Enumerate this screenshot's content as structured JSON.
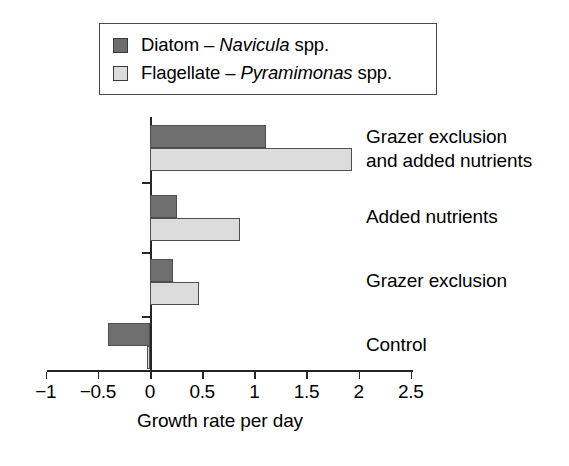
{
  "legend": {
    "items": [
      {
        "swatch": "dark-gray-swatch",
        "prefix": "Diatom – ",
        "species": "Navicula",
        "suffix": " spp.",
        "color": "#6e6e6e"
      },
      {
        "swatch": "light-gray-swatch",
        "prefix": "Flagellate – ",
        "species": "Pyramimonas",
        "suffix": " spp.",
        "color": "#dcdcdc"
      }
    ]
  },
  "axis": {
    "title": "Growth rate per day",
    "ticks": [
      "−1",
      "−0.5",
      "0",
      "0.5",
      "1",
      "1.5",
      "2",
      "2.5"
    ]
  },
  "chart_data": {
    "type": "bar",
    "orientation": "horizontal",
    "title": "",
    "xlabel": "Growth rate per day",
    "ylabel": "",
    "xlim": [
      -1,
      2.5
    ],
    "xticks": [
      -1,
      -0.5,
      0,
      0.5,
      1,
      1.5,
      2,
      2.5
    ],
    "grid": false,
    "legend_position": "top-left",
    "categories": [
      "Grazer exclusion\nand added nutrients",
      "Added nutrients",
      "Grazer exclusion",
      "Control"
    ],
    "series": [
      {
        "name": "Diatom – Navicula spp.",
        "color": "#6e6e6e",
        "values": [
          1.11,
          0.26,
          0.22,
          -0.4
        ]
      },
      {
        "name": "Flagellate – Pyramimonas spp.",
        "color": "#dcdcdc",
        "values": [
          1.94,
          0.86,
          0.47,
          -0.03
        ]
      }
    ]
  }
}
